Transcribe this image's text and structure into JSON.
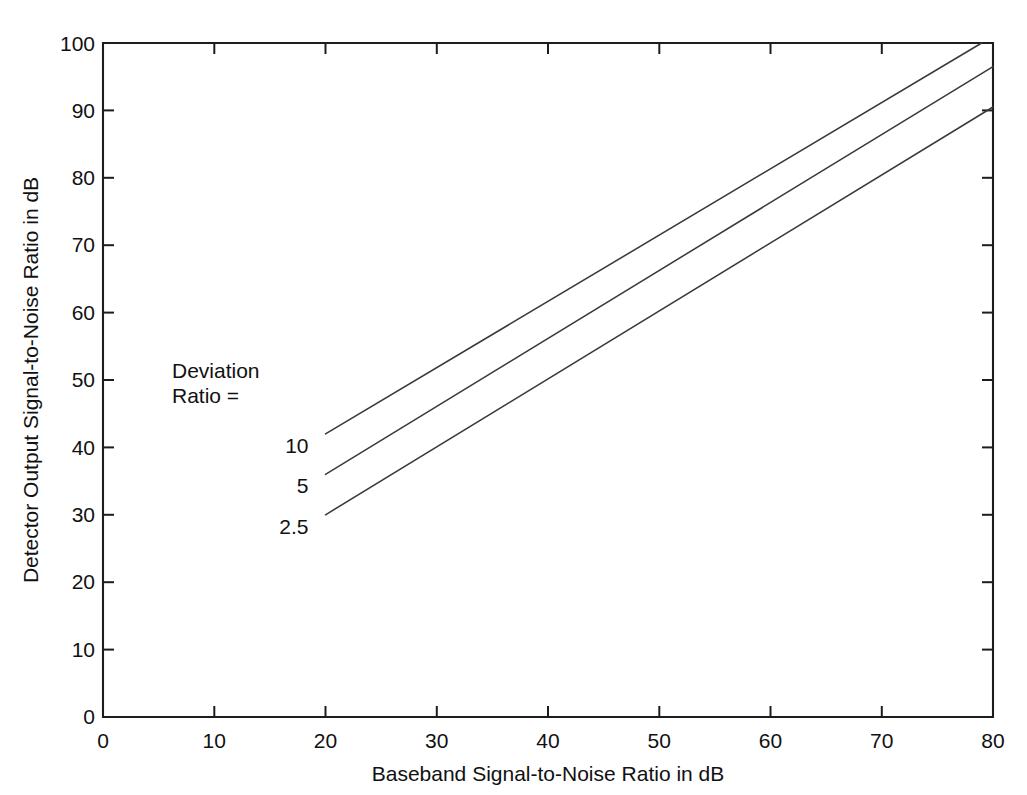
{
  "chart_data": {
    "type": "line",
    "title": "",
    "xlabel": "Baseband Signal-to-Noise Ratio in dB",
    "ylabel": "Detector Output Signal-to-Noise Ratio in dB",
    "xlim": [
      0,
      80
    ],
    "ylim": [
      0,
      100
    ],
    "xticks": [
      0,
      10,
      20,
      30,
      40,
      50,
      60,
      70,
      80
    ],
    "yticks": [
      0,
      10,
      20,
      30,
      40,
      50,
      60,
      70,
      80,
      90,
      100
    ],
    "xtick_labels": [
      "0",
      "10",
      "20",
      "30",
      "40",
      "50",
      "60",
      "70",
      "80"
    ],
    "ytick_labels": [
      "0",
      "10",
      "20",
      "30",
      "40",
      "50",
      "60",
      "70",
      "80",
      "90",
      "100"
    ],
    "grid": false,
    "legend_position": "inside-left-annotation",
    "annotation": {
      "line1": "Deviation",
      "line2": "Ratio ="
    },
    "series": [
      {
        "name": "10",
        "label": "10",
        "x": [
          20,
          80
        ],
        "y": [
          42,
          101
        ],
        "color": "#3a3a3a",
        "label_point": [
          20,
          40.2
        ]
      },
      {
        "name": "5",
        "label": "5",
        "x": [
          20,
          80
        ],
        "y": [
          36,
          96.5
        ],
        "color": "#3a3a3a",
        "label_point": [
          20,
          34.2
        ]
      },
      {
        "name": "2.5",
        "label": "2.5",
        "x": [
          20,
          80
        ],
        "y": [
          30,
          90.5
        ],
        "color": "#3a3a3a",
        "label_point": [
          20,
          28.2
        ]
      }
    ]
  }
}
